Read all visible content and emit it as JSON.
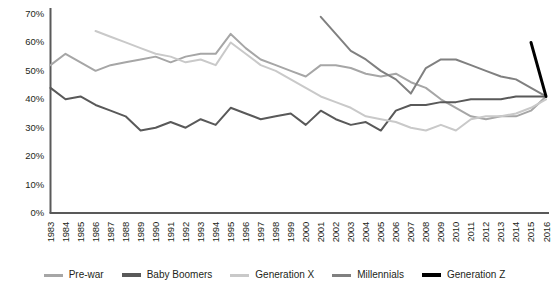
{
  "chart_data": {
    "type": "line",
    "title": "",
    "subtitle": "",
    "xlabel": "",
    "ylabel": "",
    "ylim": [
      0,
      70
    ],
    "ytick_labels": [
      "0%",
      "10%",
      "20%",
      "30%",
      "40%",
      "50%",
      "60%",
      "70%"
    ],
    "ytick_values": [
      0,
      10,
      20,
      30,
      40,
      50,
      60,
      70
    ],
    "grid": false,
    "legend_position": "bottom",
    "categories": [
      "1983",
      "1984",
      "1985",
      "1986",
      "1987",
      "1988",
      "1989",
      "1990",
      "1991",
      "1992",
      "1993",
      "1994",
      "1995",
      "1996",
      "1997",
      "1998",
      "1999",
      "2000",
      "2001",
      "2002",
      "2003",
      "2004",
      "2005",
      "2006",
      "2007",
      "2008",
      "2009",
      "2010",
      "2011",
      "2012",
      "2013",
      "2014",
      "2015",
      "2016"
    ],
    "series": [
      {
        "name": "Pre-war",
        "color": "#a6a6a6",
        "width": 2,
        "values": [
          52,
          56,
          53,
          50,
          52,
          53,
          54,
          55,
          53,
          55,
          56,
          56,
          63,
          58,
          54,
          52,
          50,
          48,
          52,
          52,
          51,
          49,
          48,
          49,
          46,
          44,
          40,
          37,
          34,
          33,
          34,
          34,
          36,
          41
        ]
      },
      {
        "name": "Baby Boomers",
        "color": "#595959",
        "width": 2,
        "values": [
          44,
          40,
          41,
          38,
          36,
          34,
          29,
          30,
          32,
          30,
          33,
          31,
          37,
          35,
          33,
          34,
          35,
          31,
          36,
          33,
          31,
          32,
          29,
          36,
          38,
          38,
          39,
          39,
          40,
          40,
          40,
          41,
          41,
          41
        ]
      },
      {
        "name": "Generation X",
        "color": "#c9c9c9",
        "width": 2,
        "values": [
          null,
          null,
          null,
          64,
          62,
          60,
          58,
          56,
          55,
          53,
          54,
          52,
          60,
          56,
          52,
          50,
          47,
          44,
          41,
          39,
          37,
          34,
          33,
          32,
          30,
          29,
          31,
          29,
          33,
          34,
          34,
          35,
          37,
          40
        ]
      },
      {
        "name": "Millennials",
        "color": "#808080",
        "width": 2,
        "values": [
          null,
          null,
          null,
          null,
          null,
          null,
          null,
          null,
          null,
          null,
          null,
          null,
          null,
          null,
          null,
          null,
          null,
          null,
          69,
          63,
          57,
          54,
          50,
          47,
          42,
          51,
          54,
          54,
          52,
          50,
          48,
          47,
          44,
          41
        ]
      },
      {
        "name": "Generation Z",
        "color": "#000000",
        "width": 3,
        "values": [
          null,
          null,
          null,
          null,
          null,
          null,
          null,
          null,
          null,
          null,
          null,
          null,
          null,
          null,
          null,
          null,
          null,
          null,
          null,
          null,
          null,
          null,
          null,
          null,
          null,
          null,
          null,
          null,
          null,
          null,
          null,
          null,
          60,
          41
        ]
      }
    ]
  },
  "axis": {
    "axis_line_color": "#595959"
  },
  "legend": {
    "items": [
      {
        "label": "Pre-war",
        "color": "#a6a6a6",
        "thick": false
      },
      {
        "label": "Baby Boomers",
        "color": "#595959",
        "thick": true
      },
      {
        "label": "Generation X",
        "color": "#c9c9c9",
        "thick": false
      },
      {
        "label": "Millennials",
        "color": "#808080",
        "thick": false
      },
      {
        "label": "Generation Z",
        "color": "#000000",
        "thick": true
      }
    ]
  }
}
